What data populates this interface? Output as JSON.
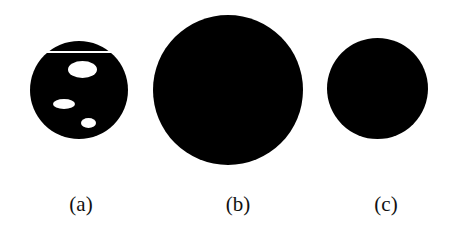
{
  "figure": {
    "panels": [
      {
        "id": "a",
        "label": "(a)",
        "shape": "circle",
        "fill": "#000000",
        "center": [
          79,
          90
        ],
        "diameter": 98,
        "features": {
          "white_line_y": 52,
          "holes": [
            {
              "cx": 82,
              "cy": 69,
              "w": 29,
              "h": 17
            },
            {
              "cx": 64,
              "cy": 104,
              "w": 22,
              "h": 10
            },
            {
              "cx": 88,
              "cy": 123,
              "w": 15,
              "h": 10
            }
          ]
        }
      },
      {
        "id": "b",
        "label": "(b)",
        "shape": "circle",
        "fill": "#000000",
        "center": [
          228,
          90
        ],
        "diameter": 150
      },
      {
        "id": "c",
        "label": "(c)",
        "shape": "circle",
        "fill": "#000000",
        "center": [
          377,
          89
        ],
        "diameter": 101
      }
    ]
  }
}
